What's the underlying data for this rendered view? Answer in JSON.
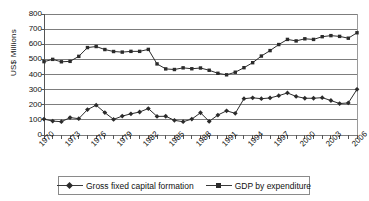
{
  "chart_data": {
    "type": "line",
    "title": "",
    "xlabel": "",
    "ylabel": "US$ Millions",
    "ylim": [
      0,
      800
    ],
    "yticks": [
      0,
      100,
      200,
      300,
      400,
      500,
      600,
      700,
      800
    ],
    "grid": true,
    "legend_position": "bottom",
    "x": [
      1970,
      1971,
      1972,
      1973,
      1974,
      1975,
      1976,
      1977,
      1978,
      1979,
      1980,
      1981,
      1982,
      1983,
      1984,
      1985,
      1986,
      1987,
      1988,
      1989,
      1990,
      1991,
      1992,
      1993,
      1994,
      1995,
      1996,
      1997,
      1998,
      1999,
      2000,
      2001,
      2002,
      2003,
      2004,
      2005,
      2006
    ],
    "xtick_labels": [
      "1970",
      "1973",
      "1976",
      "1979",
      "1982",
      "1985",
      "1988",
      "1991",
      "1994",
      "1997",
      "2000",
      "2003",
      "2006"
    ],
    "xtick_values": [
      1970,
      1973,
      1976,
      1979,
      1982,
      1985,
      1988,
      1991,
      1994,
      1997,
      2000,
      2003,
      2006
    ],
    "series": [
      {
        "name": "Gross fixed capital formation",
        "marker": "diamond",
        "color": "#2b2b2b",
        "values": [
          105,
          92,
          88,
          115,
          108,
          168,
          197,
          148,
          103,
          125,
          140,
          152,
          175,
          123,
          124,
          97,
          88,
          105,
          147,
          90,
          132,
          160,
          143,
          240,
          246,
          240,
          245,
          260,
          278,
          255,
          243,
          243,
          247,
          228,
          208,
          212,
          302
        ]
      },
      {
        "name": "GDP by expenditure",
        "marker": "square",
        "color": "#2b2b2b",
        "values": [
          485,
          500,
          484,
          487,
          520,
          578,
          585,
          565,
          552,
          548,
          553,
          553,
          566,
          470,
          437,
          433,
          444,
          438,
          443,
          428,
          408,
          398,
          415,
          445,
          478,
          522,
          558,
          598,
          632,
          622,
          636,
          632,
          650,
          657,
          652,
          640,
          676
        ]
      }
    ]
  },
  "legend": {
    "entries": [
      {
        "label": "Gross fixed capital formation",
        "marker": "diamond-marker"
      },
      {
        "label": "GDP by expenditure",
        "marker": "square-marker"
      }
    ]
  },
  "axis": {
    "y_title": "US$ Millions"
  }
}
